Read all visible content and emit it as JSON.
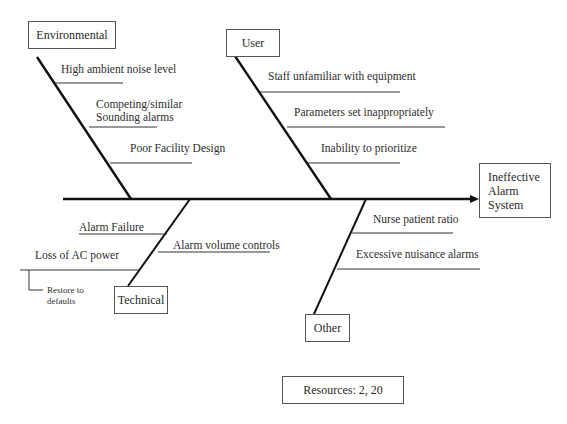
{
  "diagram": {
    "type": "fishbone",
    "effect": "Ineffective\nAlarm\nSystem",
    "categories": {
      "environmental": {
        "label": "Environmental",
        "causes": [
          "High ambient noise level",
          "Competing/similar",
          "Sounding alarms",
          "Poor Facility Design"
        ]
      },
      "user": {
        "label": "User",
        "causes": [
          "Staff unfamiliar with equipment",
          "Parameters set inappropriately",
          "Inability to prioritize"
        ]
      },
      "technical": {
        "label": "Technical",
        "causes": [
          "Alarm Failure",
          "Alarm volume controls",
          "Loss of AC power"
        ],
        "sub_causes": [
          "Restore to",
          "defaults"
        ]
      },
      "other": {
        "label": "Other",
        "causes": [
          "Nurse patient ratio",
          "Excessive nuisance alarms"
        ]
      }
    },
    "resources": "Resources: 2, 20"
  },
  "colors": {
    "line": "#111111",
    "box_border": "#555555",
    "text": "#2e2e2e"
  }
}
